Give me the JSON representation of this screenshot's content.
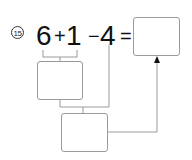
{
  "problem": {
    "number_label": "15",
    "terms": {
      "a": "6",
      "op1": "+",
      "b": "1",
      "op2": "−",
      "c": "4",
      "equals": "="
    }
  },
  "boxes": {
    "step1": "",
    "step2": "",
    "answer": ""
  },
  "colors": {
    "line": "#9a9a9a",
    "text": "#111111",
    "arrow": "#111111"
  }
}
